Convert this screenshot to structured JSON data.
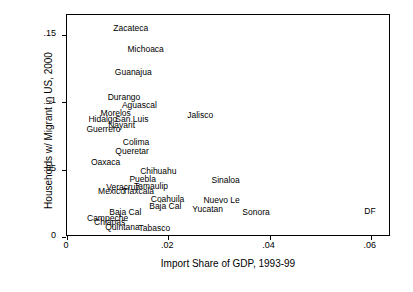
{
  "chart_data": {
    "type": "scatter",
    "title": "",
    "xlabel": "Import Share of GDP, 1993-99",
    "ylabel": "Households w/ Migrant in US, 2000",
    "xlim": [
      0,
      0.064
    ],
    "ylim": [
      0,
      0.165
    ],
    "xticks": [
      "0",
      ".02",
      ".04",
      ".06"
    ],
    "xtick_values": [
      0,
      0.02,
      0.04,
      0.06
    ],
    "yticks": [
      "0",
      ".05",
      ".1",
      ".15"
    ],
    "ytick_values": [
      0,
      0.05,
      0.1,
      0.15
    ],
    "grid": false,
    "legend": "none",
    "marker": "text-label-only",
    "points": [
      {
        "label": "Zacateca",
        "x": 0.0128,
        "y": 0.1535
      },
      {
        "label": "Michoaca",
        "x": 0.0157,
        "y": 0.1385
      },
      {
        "label": "Guanajua",
        "x": 0.0133,
        "y": 0.1215
      },
      {
        "label": "Durango",
        "x": 0.0115,
        "y": 0.1022
      },
      {
        "label": "Aguascal",
        "x": 0.0145,
        "y": 0.0968
      },
      {
        "label": "Morelos",
        "x": 0.0098,
        "y": 0.0905
      },
      {
        "label": "San Luis",
        "x": 0.013,
        "y": 0.0862
      },
      {
        "label": "Hidalgo",
        "x": 0.0073,
        "y": 0.0862
      },
      {
        "label": "Jalisco",
        "x": 0.0265,
        "y": 0.0895
      },
      {
        "label": "Nayarit",
        "x": 0.011,
        "y": 0.0818
      },
      {
        "label": "Guerrero",
        "x": 0.0074,
        "y": 0.0785
      },
      {
        "label": "Colima",
        "x": 0.0138,
        "y": 0.0688
      },
      {
        "label": "Queretar",
        "x": 0.0131,
        "y": 0.0628
      },
      {
        "label": "Oaxaca",
        "x": 0.0078,
        "y": 0.0545
      },
      {
        "label": "Chihuahu",
        "x": 0.0182,
        "y": 0.0478
      },
      {
        "label": "Puebla",
        "x": 0.0151,
        "y": 0.0418
      },
      {
        "label": "Sinaloa",
        "x": 0.0315,
        "y": 0.0412
      },
      {
        "label": "Tamaulip",
        "x": 0.0168,
        "y": 0.0362
      },
      {
        "label": "Veracruz",
        "x": 0.0113,
        "y": 0.0358
      },
      {
        "label": "Tlaxcala",
        "x": 0.0143,
        "y": 0.0328
      },
      {
        "label": "Mexico",
        "x": 0.009,
        "y": 0.0325
      },
      {
        "label": "Coahuila",
        "x": 0.0201,
        "y": 0.0265
      },
      {
        "label": "Nuevo Le",
        "x": 0.0307,
        "y": 0.0258
      },
      {
        "label": "Baja Cal",
        "x": 0.0196,
        "y": 0.0212
      },
      {
        "label": "Yucatan",
        "x": 0.028,
        "y": 0.0195
      },
      {
        "label": "Sonora",
        "x": 0.0375,
        "y": 0.0172
      },
      {
        "label": "DF",
        "x": 0.06,
        "y": 0.0175
      },
      {
        "label": "Baja Cal",
        "x": 0.0117,
        "y": 0.0168
      },
      {
        "label": "Campeche",
        "x": 0.0082,
        "y": 0.0128
      },
      {
        "label": "Chiapas",
        "x": 0.0086,
        "y": 0.0098
      },
      {
        "label": "Quintana",
        "x": 0.0112,
        "y": 0.0062
      },
      {
        "label": "Tabasco",
        "x": 0.0175,
        "y": 0.0055
      }
    ]
  }
}
